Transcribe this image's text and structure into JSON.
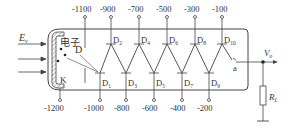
{
  "diagram": {
    "input_label": "E",
    "input_label_sub": "v",
    "electron_label": "电子",
    "focus_label": "D",
    "cathode_label": "K",
    "anode_label": "a",
    "output_label": "V",
    "output_label_sub": "o",
    "load_label": "R",
    "load_label_sub": "L",
    "cathode_voltage": "-1200",
    "focus_voltage": "-1100",
    "top_dynodes": [
      {
        "label": "D",
        "sub": "2",
        "voltage": "-900"
      },
      {
        "label": "D",
        "sub": "4",
        "voltage": "-700"
      },
      {
        "label": "D",
        "sub": "6",
        "voltage": "-500"
      },
      {
        "label": "D",
        "sub": "8",
        "voltage": "-300"
      },
      {
        "label": "D",
        "sub": "10",
        "voltage": "-100"
      }
    ],
    "bottom_dynodes": [
      {
        "label": "D",
        "sub": "1",
        "voltage": "-1000"
      },
      {
        "label": "D",
        "sub": "3",
        "voltage": "-800"
      },
      {
        "label": "D",
        "sub": "5",
        "voltage": "-600"
      },
      {
        "label": "D",
        "sub": "7",
        "voltage": "-400"
      },
      {
        "label": "D",
        "sub": "9",
        "voltage": "-200"
      }
    ]
  }
}
